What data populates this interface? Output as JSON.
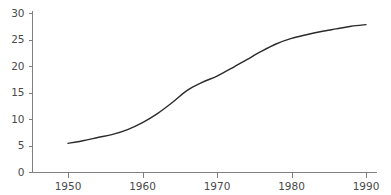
{
  "chart_data": {
    "type": "line",
    "title": "",
    "subtitle": "",
    "xlabel": "",
    "ylabel": "",
    "xlim": [
      1945,
      1993
    ],
    "ylim": [
      0,
      31
    ],
    "grid": false,
    "legend": null,
    "legend_position": "none",
    "xticks": [
      1950,
      1960,
      1970,
      1980,
      1990
    ],
    "xtick_labels": [
      "1950",
      "1960",
      "1970",
      "1980",
      "1990"
    ],
    "yticks": [
      0,
      5,
      10,
      15,
      20,
      25,
      30
    ],
    "ytick_labels": [
      "0",
      "5",
      "10",
      "15",
      "20",
      "25",
      "30"
    ],
    "series": [
      {
        "name": "series-1",
        "color": "#2b2b2b",
        "x": [
          1950,
          1952,
          1954,
          1956,
          1958,
          1960,
          1962,
          1964,
          1966,
          1968,
          1970,
          1972,
          1974,
          1976,
          1978,
          1980,
          1982,
          1984,
          1986,
          1988,
          1990
        ],
        "values": [
          5.4,
          5.9,
          6.5,
          7.1,
          8.0,
          9.3,
          11.0,
          13.1,
          15.4,
          16.9,
          18.1,
          19.6,
          21.2,
          22.8,
          24.2,
          25.2,
          25.9,
          26.5,
          27.0,
          27.5,
          27.8
        ]
      }
    ]
  },
  "axes": {
    "y_axis_color": "#808080",
    "x_axis_color": "#808080",
    "line_color": "#2b2b2b",
    "background": "#ffffff"
  }
}
